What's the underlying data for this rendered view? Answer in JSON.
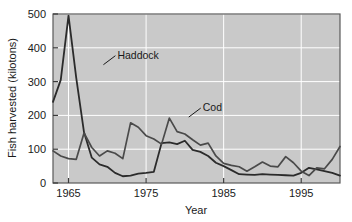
{
  "chart_data": {
    "type": "line",
    "title": "",
    "xlabel": "Year",
    "ylabel": "Fish harvested (kilotons)",
    "xlim": [
      1963,
      2000
    ],
    "ylim": [
      0,
      500
    ],
    "xticks": [
      1965,
      1975,
      1985,
      1995
    ],
    "yticks": [
      0,
      100,
      200,
      300,
      400,
      500
    ],
    "grid": true,
    "legend_position": "inline-annotations",
    "annotations": [
      {
        "text": "Haddock",
        "series": "Haddock",
        "x": 1969.5,
        "y": 350
      },
      {
        "text": "Cod",
        "series": "Cod",
        "x": 1980.5,
        "y": 195
      }
    ],
    "series": [
      {
        "name": "Haddock",
        "color": "#2b2b2b",
        "x": [
          1963,
          1964,
          1965,
          1966,
          1967,
          1968,
          1969,
          1970,
          1971,
          1972,
          1973,
          1974,
          1975,
          1976,
          1977,
          1978,
          1979,
          1980,
          1981,
          1982,
          1983,
          1984,
          1985,
          1986,
          1987,
          1988,
          1989,
          1990,
          1991,
          1992,
          1993,
          1994,
          1995,
          1996,
          1997,
          1998,
          1999,
          2000
        ],
        "y": [
          240,
          305,
          495,
          310,
          150,
          75,
          55,
          48,
          30,
          20,
          22,
          28,
          30,
          33,
          118,
          120,
          115,
          125,
          98,
          92,
          80,
          60,
          50,
          38,
          26,
          25,
          24,
          26,
          25,
          24,
          23,
          22,
          30,
          45,
          40,
          35,
          30,
          22
        ]
      },
      {
        "name": "Cod",
        "color": "#4a4a4a",
        "x": [
          1963,
          1964,
          1965,
          1966,
          1967,
          1968,
          1969,
          1970,
          1971,
          1972,
          1973,
          1974,
          1975,
          1976,
          1977,
          1978,
          1979,
          1980,
          1981,
          1982,
          1983,
          1984,
          1985,
          1986,
          1987,
          1988,
          1989,
          1990,
          1991,
          1992,
          1993,
          1994,
          1995,
          1996,
          1997,
          1998,
          1999,
          2000
        ],
        "y": [
          95,
          80,
          72,
          70,
          148,
          105,
          80,
          95,
          88,
          72,
          178,
          165,
          140,
          130,
          115,
          192,
          152,
          145,
          128,
          112,
          118,
          80,
          58,
          52,
          48,
          35,
          48,
          62,
          50,
          48,
          78,
          60,
          35,
          22,
          45,
          42,
          70,
          108
        ]
      }
    ]
  }
}
